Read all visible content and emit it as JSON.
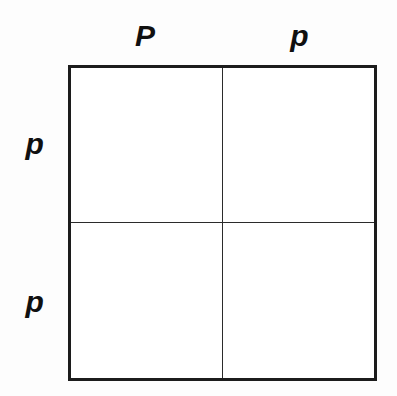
{
  "figure": {
    "type": "punnett-square",
    "title": "",
    "background_color": "#fdfdfd",
    "line_color": "#1c1c1c",
    "cell_background": "#ffffff",
    "text_color": "#101010"
  },
  "top_labels": [
    {
      "text": "P"
    },
    {
      "text": "p"
    }
  ],
  "side_labels": [
    {
      "text": "p"
    },
    {
      "text": "p"
    }
  ],
  "cells": [
    [
      {
        "text": ""
      },
      {
        "text": ""
      }
    ],
    [
      {
        "text": ""
      },
      {
        "text": ""
      }
    ]
  ]
}
